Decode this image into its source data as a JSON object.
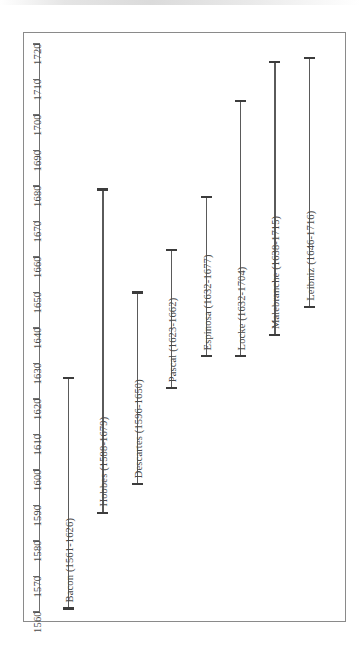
{
  "chart_data": {
    "type": "bar",
    "orientation": "vertical-timeline-rotated",
    "title": "",
    "subtitle": "",
    "xlabel": "",
    "ylabel": "",
    "axis": {
      "name": "year",
      "min": 1560,
      "max": 1720,
      "tick_step": 10,
      "ticks": [
        1560,
        1570,
        1580,
        1590,
        1600,
        1610,
        1620,
        1630,
        1640,
        1650,
        1660,
        1670,
        1680,
        1690,
        1700,
        1710,
        1720
      ],
      "tick_labels": [
        "1560",
        "1570",
        "1580",
        "1590",
        "1600",
        "1610",
        "1620",
        "1630",
        "1640",
        "1650",
        "1660",
        "1670",
        "1680",
        "1690",
        "1700",
        "1710",
        "1720"
      ],
      "grid": false,
      "position": "left"
    },
    "legend": {
      "shown": false,
      "position": "none"
    },
    "categories": [
      "Bacon",
      "Hobbes",
      "Descartes",
      "Pascal",
      "Espinosa",
      "Locke",
      "Malebranche",
      "Leibniz"
    ],
    "series": [
      {
        "name": "lifespan_start",
        "values": [
          1561,
          1588,
          1596,
          1623,
          1632,
          1632,
          1638,
          1646
        ]
      },
      {
        "name": "lifespan_end",
        "values": [
          1626,
          1679,
          1650,
          1662,
          1677,
          1704,
          1715,
          1716
        ]
      }
    ],
    "bars": [
      {
        "label": "Bacon (1561-1626)",
        "name": "Bacon",
        "birth": 1561,
        "death": 1626,
        "span": 65
      },
      {
        "label": "Hobbes (1588-1679)",
        "name": "Hobbes",
        "birth": 1588,
        "death": 1679,
        "span": 91
      },
      {
        "label": "Descartes (1596-1650)",
        "name": "Descartes",
        "birth": 1596,
        "death": 1650,
        "span": 54
      },
      {
        "label": "Pascal (1623-1662)",
        "name": "Pascal",
        "birth": 1623,
        "death": 1662,
        "span": 39
      },
      {
        "label": "Espinosa (1632-1677)",
        "name": "Espinosa",
        "birth": 1632,
        "death": 1677,
        "span": 45
      },
      {
        "label": "Locke (1632-1704)",
        "name": "Locke",
        "birth": 1632,
        "death": 1704,
        "span": 72
      },
      {
        "label": "Malebranche (1638-1715)",
        "name": "Malebranche",
        "birth": 1638,
        "death": 1715,
        "span": 77
      },
      {
        "label": "Leibniz (1646-1716)",
        "name": "Leibniz",
        "birth": 1646,
        "death": 1716,
        "span": 70
      }
    ],
    "colors": {
      "bar": "#5a5a5a",
      "cap": "#3c3c3c",
      "axis": "#6f6f6f",
      "frame": "#8a8a8a",
      "text": "#4a4a4a",
      "background": "#ffffff"
    }
  }
}
